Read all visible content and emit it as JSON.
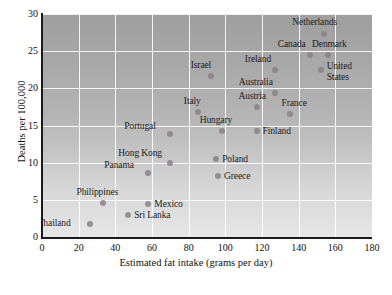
{
  "chart_data": {
    "type": "scatter",
    "title": "",
    "xlabel": "Estimated fat intake (grams per day)",
    "ylabel": "Deaths per 100,000",
    "xlim": [
      0,
      180
    ],
    "ylim": [
      0,
      30
    ],
    "xticks": [
      0,
      20,
      40,
      60,
      80,
      100,
      120,
      140,
      160,
      180
    ],
    "yticks": [
      0,
      5,
      10,
      15,
      20,
      25,
      30
    ],
    "grid": true,
    "legend": "none",
    "point_color": "#8a8088",
    "plot_background": "gray gradient, dark at top to light at bottom",
    "points": [
      {
        "label": "Thailand",
        "x": 26,
        "y": 1.8,
        "label_dx": -52,
        "label_dy": -6,
        "lines": [
          "Thailand"
        ]
      },
      {
        "label": "Philippines",
        "x": 33,
        "y": 4.6,
        "label_dx": -26,
        "label_dy": -16,
        "lines": [
          "Philippines"
        ]
      },
      {
        "label": "Sri Lanka",
        "x": 47,
        "y": 3.0,
        "label_dx": 6,
        "label_dy": -5,
        "lines": [
          "Sri Lanka"
        ]
      },
      {
        "label": "Mexico",
        "x": 58,
        "y": 4.5,
        "label_dx": 6,
        "label_dy": -5,
        "lines": [
          "Mexico"
        ]
      },
      {
        "label": "Panama",
        "x": 58,
        "y": 8.6,
        "label_dx": -44,
        "label_dy": -13,
        "lines": [
          "Panama"
        ]
      },
      {
        "label": "Hong Kong",
        "x": 70,
        "y": 9.9,
        "label_dx": -52,
        "label_dy": -15,
        "lines": [
          "Hong Kong"
        ]
      },
      {
        "label": "Portugal",
        "x": 70,
        "y": 13.9,
        "label_dx": -46,
        "label_dy": -13,
        "lines": [
          "Portugal"
        ]
      },
      {
        "label": "Italy",
        "x": 85,
        "y": 16.8,
        "label_dx": -14,
        "label_dy": -16,
        "lines": [
          "Italy"
        ]
      },
      {
        "label": "Israel",
        "x": 92,
        "y": 21.6,
        "label_dx": -20,
        "label_dy": -16,
        "lines": [
          "Israel"
        ]
      },
      {
        "label": "Greece",
        "x": 96,
        "y": 8.2,
        "label_dx": 6,
        "label_dy": -5,
        "lines": [
          "Greece"
        ]
      },
      {
        "label": "Poland",
        "x": 95,
        "y": 10.5,
        "label_dx": 6,
        "label_dy": -5,
        "lines": [
          "Poland"
        ]
      },
      {
        "label": "Hungary",
        "x": 98,
        "y": 14.2,
        "label_dx": -22,
        "label_dy": -16,
        "lines": [
          "Hungary"
        ]
      },
      {
        "label": "Finland",
        "x": 117,
        "y": 14.2,
        "label_dx": 6,
        "label_dy": -5,
        "lines": [
          "Finland"
        ]
      },
      {
        "label": "Austria",
        "x": 117,
        "y": 17.5,
        "label_dx": -18,
        "label_dy": -16,
        "lines": [
          "Austria"
        ]
      },
      {
        "label": "Australia",
        "x": 127,
        "y": 19.4,
        "label_dx": -36,
        "label_dy": -16,
        "lines": [
          "Australia"
        ]
      },
      {
        "label": "Ireland",
        "x": 127,
        "y": 22.5,
        "label_dx": -30,
        "label_dy": -16,
        "lines": [
          "Ireland"
        ]
      },
      {
        "label": "France",
        "x": 135,
        "y": 16.5,
        "label_dx": -8,
        "label_dy": -16,
        "lines": [
          "France"
        ]
      },
      {
        "label": "Canada",
        "x": 146,
        "y": 24.5,
        "label_dx": -32,
        "label_dy": -16,
        "lines": [
          "Canada"
        ]
      },
      {
        "label": "United States",
        "x": 152,
        "y": 22.4,
        "label_dx": 6,
        "label_dy": -5,
        "lines": [
          "United",
          "States"
        ]
      },
      {
        "label": "Netherlands",
        "x": 154,
        "y": 27.3,
        "label_dx": -32,
        "label_dy": -17,
        "lines": [
          "Netherlands"
        ]
      },
      {
        "label": "Denmark",
        "x": 156,
        "y": 24.5,
        "label_dx": -16,
        "label_dy": -16,
        "lines": [
          "Denmark"
        ]
      }
    ]
  }
}
